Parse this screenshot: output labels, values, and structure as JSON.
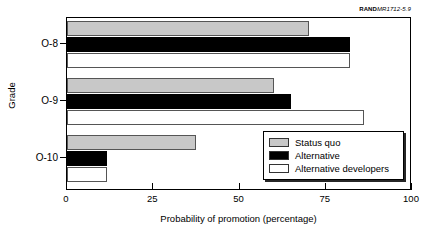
{
  "source_note": {
    "brand": "RAND",
    "id": "MR1712-5.9"
  },
  "chart_data": {
    "type": "bar",
    "orientation": "horizontal",
    "title": "",
    "xlabel": "Probability of promotion (percentage)",
    "ylabel": "Grade",
    "xlim": [
      0,
      100
    ],
    "xticks": [
      0,
      25,
      50,
      75,
      100
    ],
    "xtick_labels": [
      "0",
      "25",
      "50",
      "75",
      "100"
    ],
    "grid": false,
    "legend_position": "inside-lower-right",
    "categories": [
      "O-8",
      "O-9",
      "O-10"
    ],
    "series": [
      {
        "name": "Status quo",
        "color": "#c8c8c8",
        "values": [
          70,
          60,
          37.5
        ]
      },
      {
        "name": "Alternative",
        "color": "#000000",
        "values": [
          82,
          65,
          11.5
        ]
      },
      {
        "name": "Alternative developers",
        "color": "#ffffff",
        "values": [
          82,
          86,
          11.5
        ]
      }
    ]
  }
}
